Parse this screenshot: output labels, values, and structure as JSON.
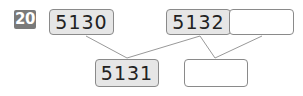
{
  "problem": {
    "number": "20",
    "top_row": [
      {
        "value": "5130",
        "filled": true
      },
      {
        "value": "5132",
        "filled": true
      },
      {
        "value": "",
        "filled": false
      }
    ],
    "bottom_row": [
      {
        "value": "5131",
        "filled": true
      },
      {
        "value": "",
        "filled": false
      }
    ]
  },
  "colors": {
    "badge": "#7a7a7a",
    "filled_box": "#e6e6e6",
    "border": "#8a8a8a",
    "line": "#999999"
  }
}
